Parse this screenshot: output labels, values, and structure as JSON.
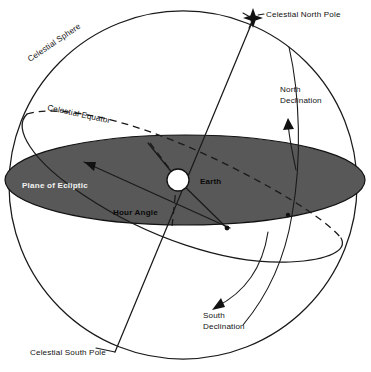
{
  "figure": {
    "kind": "astronomy-diagram",
    "background_color": "#ffffff",
    "line_color": "#1a1a1a",
    "ecliptic_fill_color": "#585858",
    "ecliptic_label_color": "#f2f2f2",
    "earth_fill_color": "#ffffff"
  },
  "labels": {
    "celestial_north_pole": "Celestial North Pole",
    "celestial_south_pole": "Celestial South Pole",
    "celestial_sphere": "Celestial Sphere",
    "celestial_equator": "Celestial Equator",
    "plane_of_ecliptic": "Plane of Ecliptic",
    "hour_angle": "Hour Angle",
    "earth": "Earth",
    "north_declination_line1": "North",
    "north_declination_line2": "Declination",
    "south_declination_line1": "South",
    "south_declination_line2": "Declination"
  },
  "markers": {
    "north_pole_star": "star-marker",
    "earth_body": "earth-circle"
  },
  "geometry": {
    "sphere_center_x": 183,
    "sphere_center_y": 185,
    "sphere_radius": 174,
    "earth_center_x": 178,
    "earth_center_y": 180,
    "earth_radius": 11,
    "ecliptic_semi_major": 180,
    "ecliptic_semi_minor": 45,
    "north_pole_x": 253,
    "north_pole_y": 18
  }
}
